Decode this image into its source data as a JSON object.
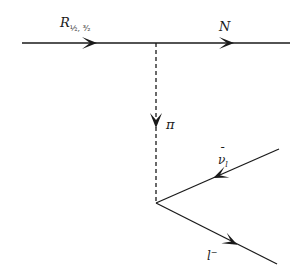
{
  "diagram": {
    "type": "feynman-diagram",
    "colors": {
      "line": "#1a1a1a",
      "background": "#ffffff"
    },
    "labels": {
      "resonance_base": "R",
      "resonance_sub": "½, ³⁄₂",
      "nucleon": "N",
      "pion": "π",
      "neutrino_base": "ν",
      "neutrino_bar": "¯",
      "neutrino_sub": "l",
      "lepton_base": "l",
      "lepton_sup": "−"
    },
    "lines": [
      {
        "id": "resonance",
        "style": "solid",
        "from": [
          22,
          43
        ],
        "to": [
          156,
          43
        ],
        "label": "R_{1/2,3/2}"
      },
      {
        "id": "nucleon",
        "style": "solid",
        "from": [
          156,
          43
        ],
        "to": [
          290,
          43
        ],
        "label": "N"
      },
      {
        "id": "pion",
        "style": "dashed",
        "from": [
          156,
          43
        ],
        "to": [
          156,
          203
        ],
        "label": "π"
      },
      {
        "id": "antineutrino",
        "style": "solid",
        "from": [
          279,
          149
        ],
        "to": [
          156,
          203
        ],
        "label": "ν̄_l"
      },
      {
        "id": "lepton",
        "style": "solid",
        "from": [
          156,
          203
        ],
        "to": [
          277,
          264
        ],
        "label": "l⁻"
      }
    ]
  }
}
